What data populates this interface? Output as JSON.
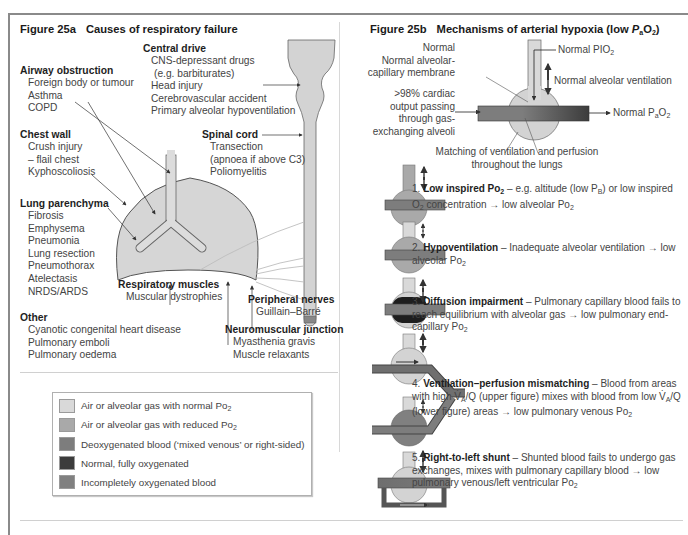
{
  "figure_a": {
    "number": "Figure 25a",
    "title": "Causes of respiratory failure",
    "central_drive": {
      "heading": "Central drive",
      "items": [
        "CNS-depressant drugs",
        "(e.g. barbiturates)",
        "Head injury",
        "Cerebrovascular accident",
        "Primary alveolar hypoventilation"
      ]
    },
    "airway_obstruction": {
      "heading": "Airway obstruction",
      "items": [
        "Foreign body or tumour",
        "Asthma",
        "COPD"
      ]
    },
    "chest_wall": {
      "heading": "Chest wall",
      "items": [
        "Crush injury",
        "– flail chest",
        "Kyphoscoliosis"
      ]
    },
    "spinal_cord": {
      "heading": "Spinal cord",
      "items": [
        "Transection",
        "(apnoea if above C3)",
        "Poliomyelitis"
      ]
    },
    "lung_parenchyma": {
      "heading": "Lung parenchyma",
      "items": [
        "Fibrosis",
        "Emphysema",
        "Pneumonia",
        "Lung resection",
        "Pneumothorax",
        "Atelectasis",
        "NRDS/ARDS"
      ]
    },
    "respiratory_muscles": {
      "heading": "Respiratory muscles",
      "items": [
        "Muscular dystrophies"
      ]
    },
    "peripheral_nerves": {
      "heading": "Peripheral nerves",
      "items": [
        "Guillain–Barré"
      ]
    },
    "other": {
      "heading": "Other",
      "items": [
        "Cyanotic congenital heart disease",
        "Pulmonary emboli",
        "Pulmonary oedema"
      ]
    },
    "neuromuscular_junction": {
      "heading": "Neuromuscular junction",
      "items": [
        "Myasthenia gravis",
        "Muscle relaxants"
      ]
    }
  },
  "legend": {
    "items": [
      {
        "label": "Air or alveolar gas with normal Po",
        "sub": "2",
        "color": "#d9d9d9"
      },
      {
        "label": "Air or alveolar gas with reduced Po",
        "sub": "2",
        "color": "#a9a9a9"
      },
      {
        "label": "Deoxygenated blood (‘mixed venous’ or right-sided)",
        "sub": "",
        "color": "#7d7d7d"
      },
      {
        "label": "Normal, fully oxygenated",
        "sub": "",
        "color": "#3c3c3c"
      },
      {
        "label": "Incompletely oxygenated blood",
        "sub": "",
        "color": "#808080"
      }
    ]
  },
  "figure_b": {
    "number": "Figure 25b",
    "title_pre": "Mechanisms of arterial hypoxia (low ",
    "title_p": "P",
    "title_sub": "a",
    "title_o": "O",
    "title_sub2": "2",
    "title_post": ")",
    "normal_labels": {
      "normal": "Normal",
      "membrane_1": "Normal alveolar-",
      "membrane_2": "capillary membrane",
      "cardiac_1": ">98% cardiac",
      "cardiac_2": "output passing",
      "cardiac_3": "through gas-",
      "cardiac_4": "exchanging alveoli",
      "pio2": "Normal PIO",
      "pio2_sub": "2",
      "ventilation": "Normal alveolar ventilation",
      "pao2": "Normal P",
      "pao2_sub": "a",
      "pao2_o": "O",
      "pao2_sub2": "2",
      "matching_1": "Matching of ventilation and perfusion",
      "matching_2": "throughout the lungs"
    },
    "mechanisms": [
      {
        "num": "1.",
        "name": "Low inspired Po",
        "name_sub": "2",
        "text": " – e.g. altitude (low P",
        "t_sub": "B",
        "text2": ") or low inspired O",
        "t_sub2": "2",
        "text3": " concentration → low alveolar Po",
        "t_sub3": "2"
      },
      {
        "num": "2.",
        "name": "Hypoventilation",
        "text": " – Inadequate alveolar ventilation → low alveolar Po",
        "t_sub": "2"
      },
      {
        "num": "3.",
        "name": "Diffusion impairment",
        "text": " – Pulmonary capillary blood fails to reach equilibrium with alveolar gas → low pulmonary end-capillary Po",
        "t_sub": "2"
      },
      {
        "num": "4.",
        "name": "Ventilation–perfusion mismatching",
        "text": " – Blood from areas with high V̇",
        "t_sub": "A",
        "text2": "/Q (upper figure) mixes with blood from low V̇",
        "t_sub2": "A",
        "text3": "/Q (lower figure) areas → low pulmonary venous Po",
        "t_sub3": "2"
      },
      {
        "num": "5.",
        "name": "Right-to-left shunt",
        "text": " – Shunted blood fails to undergo gas exchanges, mixes with pulmonary capillary blood → low pulmonary venous/left ventricular Po",
        "t_sub": "2"
      }
    ]
  },
  "colors": {
    "normal_gas": "#d9d9d9",
    "reduced_gas": "#a9a9a9",
    "deoxygenated": "#7d7d7d",
    "oxygenated": "#3c3c3c",
    "incomplete": "#808080",
    "lung_fill": "#d3d3d3",
    "stroke": "#555555"
  }
}
